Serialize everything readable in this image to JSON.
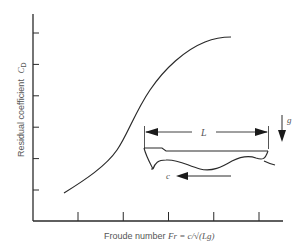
{
  "chart_data": {
    "type": "line",
    "title": "",
    "xlabel": "Froude number Fr = c/√(Lg)",
    "ylabel": "Residual coefficient C_D",
    "x_ticks_count": 5,
    "y_ticks_count": 6,
    "x_tick_labels": [],
    "y_tick_labels": [],
    "grid": false,
    "legend": null,
    "series": [
      {
        "name": "Residual coefficient",
        "description": "S-shaped curve rising from low Fr, steepest near middle, leveling at high Fr",
        "x": [
          0.7,
          1.0,
          1.5,
          2.0,
          2.5,
          3.0,
          3.5,
          4.0,
          4.6
        ],
        "y": [
          0.9,
          1.25,
          1.85,
          2.5,
          3.5,
          4.3,
          4.85,
          5.1,
          5.2
        ]
      }
    ],
    "xlim": [
      0,
      5.5
    ],
    "ylim": [
      0,
      6.2
    ],
    "annotations": [
      {
        "type": "inset-diagram",
        "description": "Ship hull of length L on wave surface moving with speed c, gravity g downward"
      }
    ]
  },
  "labels": {
    "ylabel_text": "Residual coefficient",
    "ylabel_symbol": "C",
    "ylabel_sub": "D",
    "xlabel_text": "Froude number ",
    "xlabel_symbol": "Fr",
    "xlabel_formula": " = c/√(Lg)"
  },
  "diagram": {
    "length_label": "L",
    "speed_label": "c",
    "gravity_label": "g"
  }
}
